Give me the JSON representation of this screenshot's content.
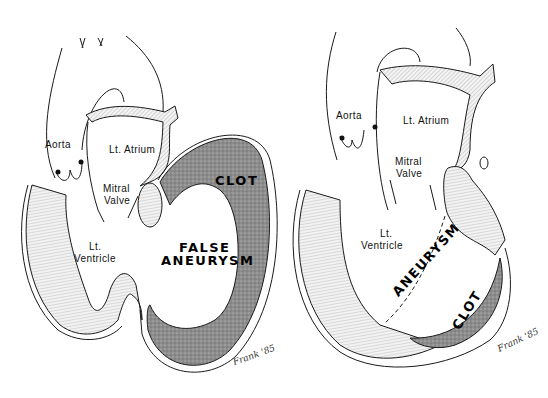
{
  "figure": {
    "panels": [
      {
        "id": "false-aneurysm",
        "labels": {
          "aorta": "Aorta",
          "left_atrium": "Lt. Atrium",
          "mitral_valve_1": "Mitral",
          "mitral_valve_2": "Valve",
          "left_ventricle_1": "Lt.",
          "left_ventricle_2": "Ventricle",
          "clot": "CLOT",
          "aneurysm_1": "FALSE",
          "aneurysm_2": "ANEURYSM"
        },
        "signature": "Frank '85"
      },
      {
        "id": "true-aneurysm",
        "labels": {
          "aorta": "Aorta",
          "left_atrium": "Lt. Atrium",
          "mitral_valve_1": "Mitral",
          "mitral_valve_2": "Valve",
          "left_ventricle_1": "Lt.",
          "left_ventricle_2": "Ventricle",
          "aneurysm": "ANEURYSM",
          "clot": "CLOT"
        },
        "signature": "Frank '85"
      }
    ],
    "colors": {
      "line": "#1a1a1a",
      "muscle_fill": "#e6e6e6",
      "clot_fill": "#8a8a8a",
      "background": "#ffffff"
    }
  }
}
